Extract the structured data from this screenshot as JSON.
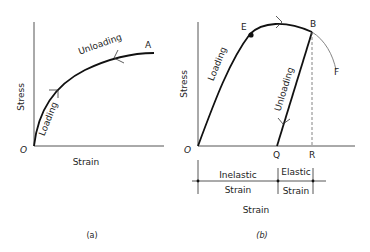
{
  "panel_a": {
    "caption": "(a)",
    "ylabel": "Stress",
    "xlabel": "Strain",
    "origin": "O",
    "point_A": "A",
    "loading_label": "Loading",
    "unloading_label": "Unloading"
  },
  "panel_b": {
    "caption": "(b)",
    "ylabel": "Stress",
    "xlabel": "Strain",
    "origin": "O",
    "point_E": "E",
    "point_B": "B",
    "point_F": "F",
    "point_Q": "Q",
    "point_R": "R",
    "loading_label": "Loading",
    "unloading_label": "Unloading",
    "inelastic_label": "Inelastic",
    "elastic_label": "Elastic",
    "strain_inelastic": "Strain",
    "strain_elastic": "Strain",
    "strain_total": "Strain"
  }
}
